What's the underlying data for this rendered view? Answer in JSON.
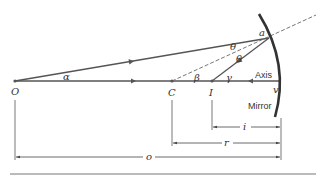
{
  "diagram": {
    "points": {
      "object": "O",
      "center": "C",
      "image": "I",
      "reflection_point": "a",
      "vertex": "v"
    },
    "angles": {
      "alpha": "α",
      "beta": "β",
      "gamma": "γ",
      "theta1": "θ",
      "theta2": "θ"
    },
    "labels": {
      "axis": "Axis",
      "mirror": "Mirror"
    },
    "dimensions": {
      "image_distance": "i",
      "radius": "r",
      "object_distance": "o"
    },
    "colors": {
      "line": "#555555",
      "mirror": "#333333",
      "text": "#333333"
    }
  }
}
